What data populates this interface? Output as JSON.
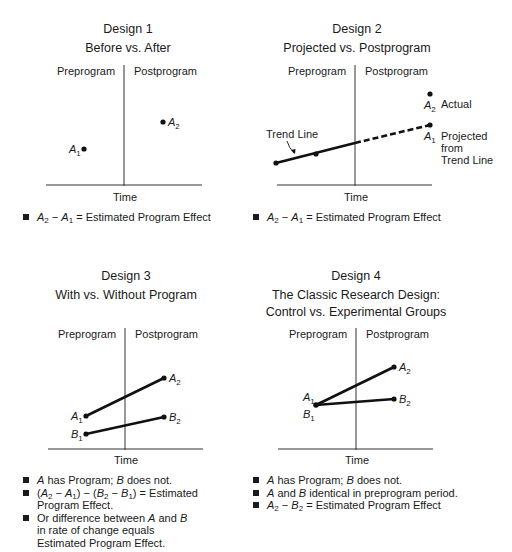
{
  "panels": [
    {
      "id": "design1",
      "heading": "Design 1",
      "subheading": "Before vs. After",
      "pre_label": "Preprogram",
      "post_label": "Postprogram",
      "x_label": "Time",
      "points": [
        {
          "label": "A",
          "sub": "1",
          "x": 84,
          "y": 149
        },
        {
          "label": "A",
          "sub": "2",
          "x": 163,
          "y": 122
        }
      ],
      "notes": [
        "A2 − A1 = Estimated Program Effect"
      ]
    },
    {
      "id": "design2",
      "heading": "Design 2",
      "subheading": "Projected vs. Postprogram",
      "pre_label": "Preprogram",
      "post_label": "Postprogram",
      "x_label": "Time",
      "trend_line_label": "Trend Line",
      "actual_label": "Actual",
      "projected_label_lines": [
        "Projected",
        "from",
        "Trend Line"
      ],
      "points": [
        {
          "label": "A",
          "sub": "2",
          "desc": "Actual"
        },
        {
          "label": "A",
          "sub": "1",
          "desc": "Projected from Trend Line"
        }
      ],
      "notes": [
        "A2 − A1 = Estimated Program Effect"
      ]
    },
    {
      "id": "design3",
      "heading": "Design 3",
      "subheading": "With vs. Without Program",
      "pre_label": "Preprogram",
      "post_label": "Postprogram",
      "x_label": "Time",
      "points": [
        {
          "label": "A",
          "sub": "1"
        },
        {
          "label": "A",
          "sub": "2"
        },
        {
          "label": "B",
          "sub": "1"
        },
        {
          "label": "B",
          "sub": "2"
        }
      ],
      "notes": [
        "A has Program; B does not.",
        "(A2 − A1) − (B2 − B1) = Estimated Program Effect.",
        "Or difference between A and B in rate of change equals Estimated Program Effect."
      ]
    },
    {
      "id": "design4",
      "heading": "Design 4",
      "subheading_lines": [
        "The Classic Research Design:",
        "Control vs. Experimental Groups"
      ],
      "pre_label": "Preprogram",
      "post_label": "Postprogram",
      "x_label": "Time",
      "points": [
        {
          "label": "A",
          "sub": "1"
        },
        {
          "label": "B",
          "sub": "1"
        },
        {
          "label": "A",
          "sub": "2"
        },
        {
          "label": "B",
          "sub": "2"
        }
      ],
      "notes": [
        "A has Program; B does not.",
        "A and B identical in preprogram period.",
        "A2 − B2 = Estimated Program Effect"
      ]
    }
  ],
  "text": {
    "d1_h": "Design 1",
    "d1_s": "Before vs. After",
    "d2_h": "Design 2",
    "d2_s": "Projected vs. Postprogram",
    "d3_h": "Design 3",
    "d3_s": "With vs. Without Program",
    "d4_h": "Design 4",
    "d4_s1": "The Classic Research Design:",
    "d4_s2": "Control vs. Experimental Groups",
    "pre": "Preprogram",
    "post": "Postprogram",
    "time": "Time",
    "A": "A",
    "B": "B",
    "s1": "1",
    "s2": "2",
    "trend": "Trend Line",
    "actual": "Actual",
    "proj1": "Projected",
    "proj2": "from",
    "proj3": "Trend Line",
    "eq_effect": " = Estimated Program Effect",
    "eq_effect_dot": " = Estimated",
    "prog_effect_dot": "Program Effect.",
    "minus": " − ",
    "has_prog": " has Program; ",
    "does_not": " does not.",
    "and": " and ",
    "identical": " identical in preprogram period.",
    "or_diff": "Or difference between ",
    "in_rate": " in rate of change equals Estimated Program Effect.",
    "lp": "(",
    "rp": ")"
  }
}
